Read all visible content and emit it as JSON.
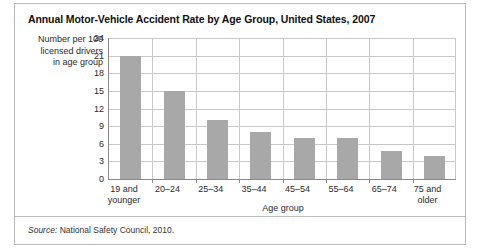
{
  "figure": {
    "title": "Annual Motor-Vehicle Accident Rate by Age Group, United States, 2007",
    "source_prefix": "Source:",
    "source_text": "National Safety Council, 2010.",
    "bar_color": "#a8a8a8",
    "axis_color": "#8a8a8a",
    "grid_color": "#c8c8c8",
    "frame_color": "#b9b9b9"
  },
  "chart_data": {
    "type": "bar",
    "title": "Annual Motor-Vehicle Accident Rate by Age Group, United States, 2007",
    "xlabel": "Age group",
    "ylabel": "Number per 100 licensed drivers in age group",
    "ylim": [
      0,
      24
    ],
    "yticks": [
      0,
      3,
      6,
      9,
      12,
      15,
      18,
      21,
      24
    ],
    "ytick_labels": [
      "0",
      "3",
      "6",
      "9",
      "12",
      "15",
      "18",
      "21",
      "24"
    ],
    "grid": "horizontal-and-vertical",
    "legend": "none",
    "categories": [
      "19 and younger",
      "20–24",
      "25–34",
      "35–44",
      "45–54",
      "55–64",
      "65–74",
      "75 and older"
    ],
    "category_lines": [
      [
        "19 and",
        "younger"
      ],
      [
        "20–24",
        ""
      ],
      [
        "25–34",
        ""
      ],
      [
        "35–44",
        ""
      ],
      [
        "45–54",
        ""
      ],
      [
        "55–64",
        ""
      ],
      [
        "65–74",
        ""
      ],
      [
        "75 and",
        "older"
      ]
    ],
    "values": [
      21.0,
      15.0,
      10.0,
      8.0,
      7.0,
      7.0,
      4.8,
      4.0
    ],
    "source": "Source: National Safety Council, 2010."
  }
}
